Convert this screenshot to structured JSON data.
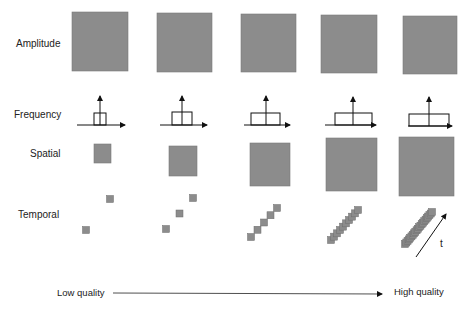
{
  "rows": {
    "amplitude": "Amplitude",
    "frequency": "Frequency",
    "spatial": "Spatial",
    "temporal": "Temporal"
  },
  "axis": {
    "low": "Low quality",
    "high": "High quality",
    "time": "t"
  },
  "colors": {
    "fill": "#8c8c8c",
    "stroke": "#7a7a7a",
    "line": "#111111"
  },
  "columns": 5,
  "amplitude_squares": [
    {
      "x": 72,
      "y": 12,
      "w": 56,
      "h": 59
    },
    {
      "x": 157,
      "y": 13,
      "w": 55,
      "h": 59
    },
    {
      "x": 241,
      "y": 14,
      "w": 55,
      "h": 58
    },
    {
      "x": 321,
      "y": 15,
      "w": 56,
      "h": 58
    },
    {
      "x": 403,
      "y": 16,
      "w": 54,
      "h": 58
    }
  ],
  "frequency_plots": [
    {
      "axis_x1": 77,
      "axis_x2": 125,
      "axis_y": 125,
      "vx": 100,
      "vtop": 96,
      "rx1": 94,
      "rx2": 106,
      "rtop": 113
    },
    {
      "axis_x1": 160,
      "axis_x2": 207,
      "axis_y": 125,
      "vx": 182,
      "vtop": 96,
      "rx1": 172,
      "rx2": 192,
      "rtop": 112
    },
    {
      "axis_x1": 244,
      "axis_x2": 290,
      "axis_y": 125,
      "vx": 266,
      "vtop": 96,
      "rx1": 251,
      "rx2": 280,
      "rtop": 113
    },
    {
      "axis_x1: ": 0,
      "axis_x1": 325,
      "axis_x2": 376,
      "axis_y": 125,
      "vx": 353,
      "vtop": 97,
      "rx1": 335,
      "rx2": 372,
      "rtop": 113
    },
    {
      "axis_x1": 408,
      "axis_x2": 452,
      "axis_y": 126,
      "vx": 429,
      "vtop": 97,
      "rx1": 409,
      "rx2": 449,
      "rtop": 114
    }
  ],
  "spatial_squares": [
    {
      "x": 94,
      "y": 144,
      "w": 17,
      "h": 19
    },
    {
      "x": 169,
      "y": 146,
      "w": 28,
      "h": 30
    },
    {
      "x": 250,
      "y": 143,
      "w": 40,
      "h": 43
    },
    {
      "x": 326,
      "y": 138,
      "w": 51,
      "h": 53
    },
    {
      "x": 399,
      "y": 137,
      "w": 55,
      "h": 59
    }
  ],
  "temporal_frames": [
    {
      "start_x": 86,
      "start_y": 230,
      "end_x": 110,
      "end_y": 199,
      "count": 2
    },
    {
      "start_x": 166,
      "start_y": 229,
      "end_x": 193,
      "end_y": 198,
      "count": 3
    },
    {
      "start_x": 251,
      "start_y": 237,
      "end_x": 277,
      "end_y": 208,
      "count": 5
    },
    {
      "start_x": 331,
      "start_y": 240,
      "end_x": 358,
      "end_y": 210,
      "count": 10
    },
    {
      "start_x": 405,
      "start_y": 244,
      "end_x": 432,
      "end_y": 212,
      "count": 22
    }
  ]
}
